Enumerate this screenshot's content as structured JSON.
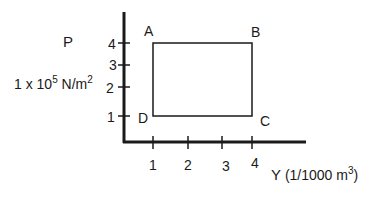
{
  "diagram": {
    "type": "pressure-volume cycle",
    "y_axis": {
      "symbol": "P",
      "unit_prefix": "1 x 10",
      "unit_exponent": "5",
      "unit_base": "N/m",
      "unit_base_exponent": "2",
      "ticks": [
        "1",
        "2",
        "3",
        "4"
      ]
    },
    "x_axis": {
      "symbol": "Y",
      "unit_open": "(1/1000 m",
      "unit_exponent": "3",
      "unit_close": ")",
      "ticks": [
        "1",
        "2",
        "3",
        "4"
      ]
    },
    "points": [
      {
        "label": "A",
        "v": 1,
        "p": 4
      },
      {
        "label": "B",
        "v": 4,
        "p": 4
      },
      {
        "label": "C",
        "v": 4,
        "p": 1
      },
      {
        "label": "D",
        "v": 1,
        "p": 1
      }
    ],
    "colors": {
      "ink": "#1a1a1a",
      "background": "#ffffff"
    }
  }
}
